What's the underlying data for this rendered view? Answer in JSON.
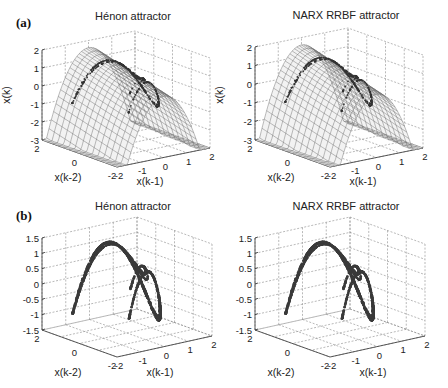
{
  "figure": {
    "rows": [
      {
        "label": "(a)",
        "type": "surface_with_trajectory"
      },
      {
        "label": "(b)",
        "type": "trajectory_3d"
      }
    ]
  },
  "chart_data": [
    {
      "type": "surface",
      "panel": "(a)",
      "title": "Hénon attractor",
      "xlabel": "x(k-1)",
      "ylabel": "x(k-2)",
      "zlabel": "x(k)",
      "xticks": [
        "-2",
        "-1",
        "0",
        "1",
        "2"
      ],
      "yticks": [
        "2",
        "0",
        "-2"
      ],
      "zticks": [
        "2",
        "1",
        "0",
        "-1",
        "-2",
        "-3"
      ],
      "xlim": [
        -2,
        2
      ],
      "ylim": [
        -2,
        2
      ],
      "zlim": [
        -3,
        2
      ],
      "grid": true,
      "surface": "x(k) = 1 - 1.4 x(k-1)^2 + 0.3 x(k-2)",
      "overlay": "Hénon attractor trajectory drawn on surface"
    },
    {
      "type": "surface",
      "panel": "(a)",
      "title": "NARX RRBF attractor",
      "xlabel": "x(k-1)",
      "ylabel": "x(k-2)",
      "zlabel": "x(k)",
      "xticks": [
        "-2",
        "-1",
        "0",
        "1",
        "2"
      ],
      "yticks": [
        "2",
        "0",
        "-2"
      ],
      "zticks": [
        "2",
        "1",
        "0",
        "-1",
        "-2",
        "-3"
      ],
      "xlim": [
        -2,
        2
      ],
      "ylim": [
        -2,
        2
      ],
      "zlim": [
        -3,
        2
      ],
      "grid": true,
      "surface": "NARX RRBF model approximation of Hénon map",
      "overlay": "model attractor trajectory drawn on surface"
    },
    {
      "type": "line3d",
      "panel": "(b)",
      "title": "Hénon attractor",
      "xlabel": "x(k-1)",
      "ylabel": "x(k-2)",
      "zlabel": "",
      "xticks": [
        "-2",
        "-1",
        "0",
        "1",
        "2"
      ],
      "yticks": [
        "2",
        "0",
        "-2"
      ],
      "zticks": [
        "1.5",
        "1",
        "0.5",
        "0",
        "-0.5",
        "-1",
        "-1.5"
      ],
      "xlim": [
        -2,
        2
      ],
      "ylim": [
        -2,
        2
      ],
      "zlim": [
        -1.5,
        1.5
      ],
      "grid": true
    },
    {
      "type": "line3d",
      "panel": "(b)",
      "title": "NARX RRBF attractor",
      "xlabel": "x(k-1)",
      "ylabel": "x(k-2)",
      "zlabel": "",
      "xticks": [
        "-2",
        "-1",
        "0",
        "1",
        "2"
      ],
      "yticks": [
        "2",
        "0",
        "-2"
      ],
      "zticks": [
        "1.5",
        "1",
        "0.5",
        "0",
        "-0.5",
        "-1",
        "-1.5"
      ],
      "xlim": [
        -2,
        2
      ],
      "ylim": [
        -2,
        2
      ],
      "zlim": [
        -1.5,
        1.5
      ],
      "grid": true
    }
  ],
  "layout": {
    "panels": [
      {
        "ox": 0,
        "left": [
          42,
          140
        ],
        "front": [
          117,
          167
        ],
        "right": [
          210,
          148
        ],
        "ztop": 50,
        "zbot": 140,
        "titleX": 133,
        "titleY": 20,
        "xlabX": 150,
        "xlabY": 185,
        "ylabX": 68,
        "ylabY": 181,
        "zlabX": 10,
        "zlabY": 95
      },
      {
        "ox": 213,
        "left": [
          42,
          140
        ],
        "front": [
          117,
          167
        ],
        "right": [
          210,
          148
        ],
        "ztop": 47,
        "zbot": 140,
        "titleX": 133,
        "titleY": 19,
        "xlabX": 150,
        "xlabY": 185,
        "ylabX": 68,
        "ylabY": 181,
        "zlabX": 10,
        "zlabY": 95
      },
      {
        "ox": 0,
        "left": [
          42,
          330
        ],
        "front": [
          117,
          357
        ],
        "right": [
          212,
          336
        ],
        "ztop": 238,
        "zbot": 330,
        "titleX": 133,
        "titleY": 210,
        "xlabX": 160,
        "xlabY": 376,
        "ylabX": 68,
        "ylabY": 376,
        "zlabX": 0,
        "zlabY": 0
      },
      {
        "ox": 213,
        "left": [
          42,
          330
        ],
        "front": [
          117,
          357
        ],
        "right": [
          212,
          336
        ],
        "ztop": 238,
        "zbot": 330,
        "titleX": 133,
        "titleY": 210,
        "xlabX": 160,
        "xlabY": 376,
        "ylabX": 68,
        "ylabY": 376,
        "zlabX": 0,
        "zlabY": 0
      }
    ],
    "panelLabels": [
      {
        "text": "(a)",
        "x": 16,
        "y": 27
      },
      {
        "text": "(b)",
        "x": 16,
        "y": 220
      }
    ]
  }
}
